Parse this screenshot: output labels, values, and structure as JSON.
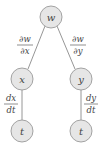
{
  "diagram": {
    "type": "tree-diagram",
    "colors": {
      "node_fill": "#e6e6e6",
      "node_stroke": "#9a9a9a",
      "edge": "#8a8a8a",
      "text": "#444444"
    },
    "nodes": [
      {
        "id": "w",
        "label": "w",
        "cx": 51,
        "cy": 17
      },
      {
        "id": "x",
        "label": "x",
        "cx": 22,
        "cy": 79
      },
      {
        "id": "y",
        "label": "y",
        "cx": 81,
        "cy": 79
      },
      {
        "id": "t1",
        "label": "t",
        "cx": 22,
        "cy": 131
      },
      {
        "id": "t2",
        "label": "t",
        "cx": 81,
        "cy": 131
      }
    ],
    "edges": [
      {
        "from": "w",
        "to": "x",
        "label_num": "∂w",
        "label_den": "∂x"
      },
      {
        "from": "w",
        "to": "y",
        "label_num": "∂w",
        "label_den": "∂y"
      },
      {
        "from": "x",
        "to": "t1",
        "label_num": "dx",
        "label_den": "dt"
      },
      {
        "from": "y",
        "to": "t2",
        "label_num": "dy",
        "label_den": "dt"
      }
    ]
  }
}
